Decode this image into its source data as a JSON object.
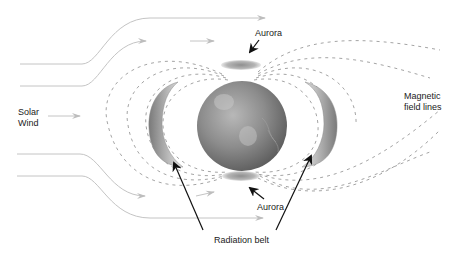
{
  "diagram": {
    "labels": {
      "solar_wind_line1": "Solar",
      "solar_wind_line2": "Wind",
      "magnetic_line1": "Magnetic",
      "magnetic_line2": "field lines",
      "aurora_top": "Aurora",
      "aurora_bottom": "Aurora",
      "radiation_belt": "Radiation belt"
    },
    "colors": {
      "flow_lines": "#bdbdbd",
      "field_lines": "#9a9a9a",
      "earth": "#8a8a8a",
      "belt": "#a0a0a0",
      "aurora": "#9e9e9e",
      "pointer_arrows": "#111111",
      "text": "#222222"
    }
  }
}
